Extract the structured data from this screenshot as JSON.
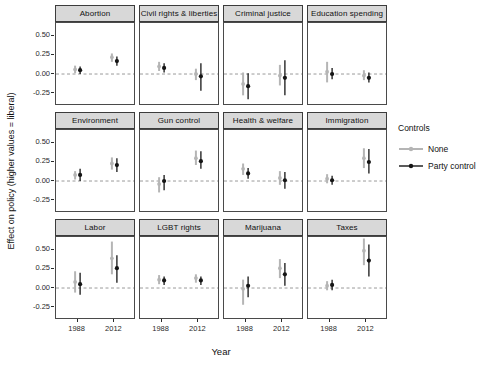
{
  "chart_data": {
    "type": "scatter",
    "subtype": "faceted-point-range",
    "xlabel": "Year",
    "ylabel": "Effect on policy (higher values = liberal)",
    "x_categories": [
      "1988",
      "2012"
    ],
    "y_ticks": [
      0.5,
      0.25,
      0.0,
      -0.25
    ],
    "y_tick_labels": [
      "0.50",
      "0.25",
      "0.00",
      "-0.25"
    ],
    "ylim": [
      -0.42,
      0.67
    ],
    "grid": false,
    "panels_per_row": 4,
    "zero_line": {
      "value": 0,
      "style": "dashed",
      "color": "#9a9a9a"
    },
    "legend": {
      "title": "Controls",
      "position": "right",
      "items": [
        {
          "label": "None",
          "color": "#b5b5b5"
        },
        {
          "label": "Party control",
          "color": "#151515"
        }
      ]
    },
    "facets": [
      {
        "label": "Abortion",
        "points": [
          {
            "x": "1988",
            "series": "None",
            "est": 0.06,
            "lo": 0.01,
            "hi": 0.11
          },
          {
            "x": "1988",
            "series": "Party control",
            "est": 0.05,
            "lo": 0.0,
            "hi": 0.1
          },
          {
            "x": "2012",
            "series": "None",
            "est": 0.22,
            "lo": 0.16,
            "hi": 0.27
          },
          {
            "x": "2012",
            "series": "Party control",
            "est": 0.17,
            "lo": 0.11,
            "hi": 0.23
          }
        ]
      },
      {
        "label": "Civil rights & liberties",
        "points": [
          {
            "x": "1988",
            "series": "None",
            "est": 0.1,
            "lo": 0.04,
            "hi": 0.16
          },
          {
            "x": "1988",
            "series": "Party control",
            "est": 0.08,
            "lo": 0.02,
            "hi": 0.14
          },
          {
            "x": "2012",
            "series": "None",
            "est": 0.0,
            "lo": -0.08,
            "hi": 0.07
          },
          {
            "x": "2012",
            "series": "Party control",
            "est": -0.03,
            "lo": -0.22,
            "hi": 0.14
          }
        ]
      },
      {
        "label": "Criminal justice",
        "points": [
          {
            "x": "1988",
            "series": "None",
            "est": -0.13,
            "lo": -0.28,
            "hi": 0.02
          },
          {
            "x": "1988",
            "series": "Party control",
            "est": -0.16,
            "lo": -0.33,
            "hi": 0.01
          },
          {
            "x": "2012",
            "series": "None",
            "est": -0.02,
            "lo": -0.15,
            "hi": 0.12
          },
          {
            "x": "2012",
            "series": "Party control",
            "est": -0.05,
            "lo": -0.28,
            "hi": 0.18
          }
        ]
      },
      {
        "label": "Education spending",
        "points": [
          {
            "x": "1988",
            "series": "None",
            "est": 0.03,
            "lo": -0.11,
            "hi": 0.16
          },
          {
            "x": "1988",
            "series": "Party control",
            "est": 0.0,
            "lo": -0.07,
            "hi": 0.08
          },
          {
            "x": "2012",
            "series": "None",
            "est": -0.02,
            "lo": -0.08,
            "hi": 0.05
          },
          {
            "x": "2012",
            "series": "Party control",
            "est": -0.05,
            "lo": -0.11,
            "hi": 0.02
          }
        ]
      },
      {
        "label": "Environment",
        "points": [
          {
            "x": "1988",
            "series": "None",
            "est": 0.08,
            "lo": 0.02,
            "hi": 0.13
          },
          {
            "x": "1988",
            "series": "Party control",
            "est": 0.08,
            "lo": 0.0,
            "hi": 0.16
          },
          {
            "x": "2012",
            "series": "None",
            "est": 0.23,
            "lo": 0.15,
            "hi": 0.31
          },
          {
            "x": "2012",
            "series": "Party control",
            "est": 0.21,
            "lo": 0.12,
            "hi": 0.3
          }
        ]
      },
      {
        "label": "Gun control",
        "points": [
          {
            "x": "1988",
            "series": "None",
            "est": -0.04,
            "lo": -0.15,
            "hi": 0.05
          },
          {
            "x": "1988",
            "series": "Party control",
            "est": 0.0,
            "lo": -0.12,
            "hi": 0.08
          },
          {
            "x": "2012",
            "series": "None",
            "est": 0.3,
            "lo": 0.21,
            "hi": 0.4
          },
          {
            "x": "2012",
            "series": "Party control",
            "est": 0.26,
            "lo": 0.16,
            "hi": 0.39
          }
        ]
      },
      {
        "label": "Health & welfare",
        "points": [
          {
            "x": "1988",
            "series": "None",
            "est": 0.16,
            "lo": 0.08,
            "hi": 0.23
          },
          {
            "x": "1988",
            "series": "Party control",
            "est": 0.1,
            "lo": 0.03,
            "hi": 0.17
          },
          {
            "x": "2012",
            "series": "None",
            "est": 0.04,
            "lo": -0.05,
            "hi": 0.13
          },
          {
            "x": "2012",
            "series": "Party control",
            "est": 0.01,
            "lo": -0.1,
            "hi": 0.12
          }
        ]
      },
      {
        "label": "Immigration",
        "points": [
          {
            "x": "1988",
            "series": "None",
            "est": 0.03,
            "lo": -0.03,
            "hi": 0.09
          },
          {
            "x": "1988",
            "series": "Party control",
            "est": 0.01,
            "lo": -0.05,
            "hi": 0.07
          },
          {
            "x": "2012",
            "series": "None",
            "est": 0.3,
            "lo": 0.17,
            "hi": 0.43
          },
          {
            "x": "2012",
            "series": "Party control",
            "est": 0.25,
            "lo": 0.1,
            "hi": 0.42
          }
        ]
      },
      {
        "label": "Labor",
        "points": [
          {
            "x": "1988",
            "series": "None",
            "est": 0.08,
            "lo": -0.06,
            "hi": 0.22
          },
          {
            "x": "1988",
            "series": "Party control",
            "est": 0.05,
            "lo": -0.09,
            "hi": 0.2
          },
          {
            "x": "2012",
            "series": "None",
            "est": 0.39,
            "lo": 0.18,
            "hi": 0.61
          },
          {
            "x": "2012",
            "series": "Party control",
            "est": 0.26,
            "lo": 0.07,
            "hi": 0.43
          }
        ]
      },
      {
        "label": "LGBT rights",
        "points": [
          {
            "x": "1988",
            "series": "None",
            "est": 0.11,
            "lo": 0.05,
            "hi": 0.17
          },
          {
            "x": "1988",
            "series": "Party control",
            "est": 0.1,
            "lo": 0.04,
            "hi": 0.15
          },
          {
            "x": "2012",
            "series": "None",
            "est": 0.13,
            "lo": 0.07,
            "hi": 0.18
          },
          {
            "x": "2012",
            "series": "Party control",
            "est": 0.1,
            "lo": 0.04,
            "hi": 0.15
          }
        ]
      },
      {
        "label": "Marijuana",
        "points": [
          {
            "x": "1988",
            "series": "None",
            "est": -0.01,
            "lo": -0.22,
            "hi": 0.11
          },
          {
            "x": "1988",
            "series": "Party control",
            "est": 0.03,
            "lo": -0.12,
            "hi": 0.15
          },
          {
            "x": "2012",
            "series": "None",
            "est": 0.26,
            "lo": 0.13,
            "hi": 0.38
          },
          {
            "x": "2012",
            "series": "Party control",
            "est": 0.18,
            "lo": 0.03,
            "hi": 0.33
          }
        ]
      },
      {
        "label": "Taxes",
        "points": [
          {
            "x": "1988",
            "series": "None",
            "est": 0.03,
            "lo": -0.03,
            "hi": 0.09
          },
          {
            "x": "1988",
            "series": "Party control",
            "est": 0.04,
            "lo": -0.03,
            "hi": 0.11
          },
          {
            "x": "2012",
            "series": "None",
            "est": 0.49,
            "lo": 0.3,
            "hi": 0.65
          },
          {
            "x": "2012",
            "series": "Party control",
            "est": 0.36,
            "lo": 0.15,
            "hi": 0.57
          }
        ]
      }
    ]
  }
}
